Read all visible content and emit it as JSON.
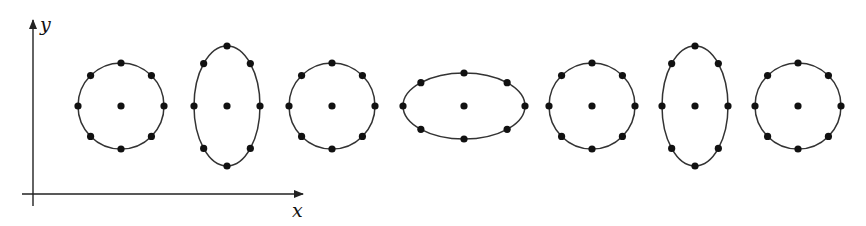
{
  "diagram": {
    "axes": {
      "x_label": "x",
      "y_label": "y",
      "origin": [
        33,
        194
      ],
      "x_axis_end": [
        303,
        194
      ],
      "y_axis_end": [
        33,
        20
      ],
      "stroke_color": "#222222"
    },
    "dot_color": "#111111",
    "curve_color": "#333333",
    "dot_radius": 3.6,
    "shapes": [
      {
        "name": "circle-1",
        "type": "circle",
        "cx": 121,
        "cy": 106,
        "rx": 43,
        "ry": 43
      },
      {
        "name": "ellipse-vertical-1",
        "type": "ellipse",
        "cx": 227,
        "cy": 106,
        "rx": 33,
        "ry": 60
      },
      {
        "name": "circle-2",
        "type": "circle",
        "cx": 332,
        "cy": 106,
        "rx": 43,
        "ry": 43
      },
      {
        "name": "ellipse-horizontal",
        "type": "ellipse",
        "cx": 464,
        "cy": 106,
        "rx": 61,
        "ry": 33
      },
      {
        "name": "circle-3",
        "type": "circle",
        "cx": 592,
        "cy": 106,
        "rx": 43,
        "ry": 43
      },
      {
        "name": "ellipse-vertical-2",
        "type": "ellipse",
        "cx": 695,
        "cy": 106,
        "rx": 33,
        "ry": 60
      },
      {
        "name": "circle-4",
        "type": "circle",
        "cx": 798,
        "cy": 106,
        "rx": 43,
        "ry": 43
      }
    ],
    "points_per_ring": 8,
    "center_dot": true
  }
}
